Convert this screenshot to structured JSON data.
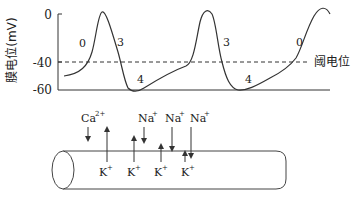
{
  "diagram": {
    "y_axis": {
      "label": "膜电位(mV)",
      "ticks": [
        "0",
        "-40",
        "-60"
      ]
    },
    "threshold_label": "阈电位",
    "phase_labels": {
      "first_phase0": "0",
      "first_phase3": "3",
      "first_phase4": "4",
      "second_phase3": "3",
      "second_phase4": "4",
      "second_phase0": "0"
    },
    "ions": {
      "ca": "Ca",
      "ca_charge": "2+",
      "na1": "Na",
      "na2": "Na",
      "na3": "Na",
      "na_charge": "+",
      "k1": "K",
      "k2": "K",
      "k3": "K",
      "k4": "K",
      "k_charge": "+"
    },
    "colors": {
      "line": "#333333",
      "text": "#222222"
    }
  }
}
